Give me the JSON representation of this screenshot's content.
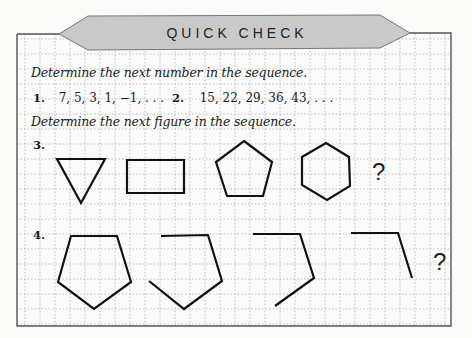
{
  "banner": {
    "title": "QUICK CHECK"
  },
  "sections": {
    "numbers": {
      "instruction": "Determine the next number in the sequence.",
      "problems": [
        {
          "number": "1.",
          "sequence": "7, 5, 3, 1, −1, . . ."
        },
        {
          "number": "2.",
          "sequence": "15, 22, 29, 36, 43, . . ."
        }
      ]
    },
    "figures": {
      "instruction": "Determine the next figure in the sequence.",
      "problems": [
        {
          "number": "3.",
          "figures": [
            "triangle",
            "rectangle",
            "pentagon",
            "hexagon"
          ],
          "unknown": "?"
        },
        {
          "number": "4.",
          "figures": [
            "pentagon-5-sides",
            "pentagon-4-sides-open",
            "pentagon-3-sides-open",
            "pentagon-2-sides-open"
          ],
          "unknown": "?"
        }
      ]
    }
  },
  "colors": {
    "banner_fill": "#c9c9c9",
    "grid_line": "#a8a8a8",
    "frame": "#555555",
    "shape_stroke": "#111111"
  }
}
